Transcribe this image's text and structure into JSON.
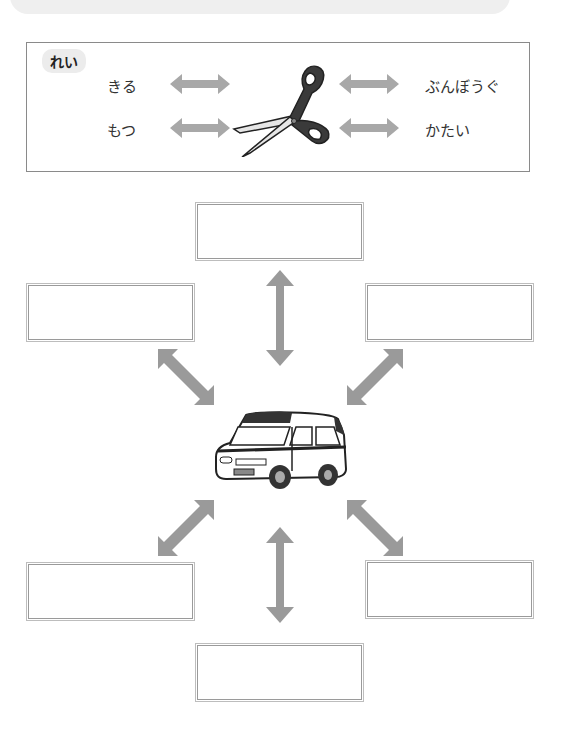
{
  "example": {
    "label": "れい",
    "left_words": [
      "きる",
      "もつ"
    ],
    "right_words": [
      "ぶんぼうぐ",
      "かたい"
    ],
    "center_icon": "scissors-icon"
  },
  "diagram": {
    "center_icon": "van-icon",
    "boxes": [
      {
        "position": "top",
        "value": ""
      },
      {
        "position": "upper-left",
        "value": ""
      },
      {
        "position": "upper-right",
        "value": ""
      },
      {
        "position": "lower-left",
        "value": ""
      },
      {
        "position": "lower-right",
        "value": ""
      },
      {
        "position": "bottom",
        "value": ""
      }
    ],
    "arrow_color": "#9a9a9a"
  }
}
